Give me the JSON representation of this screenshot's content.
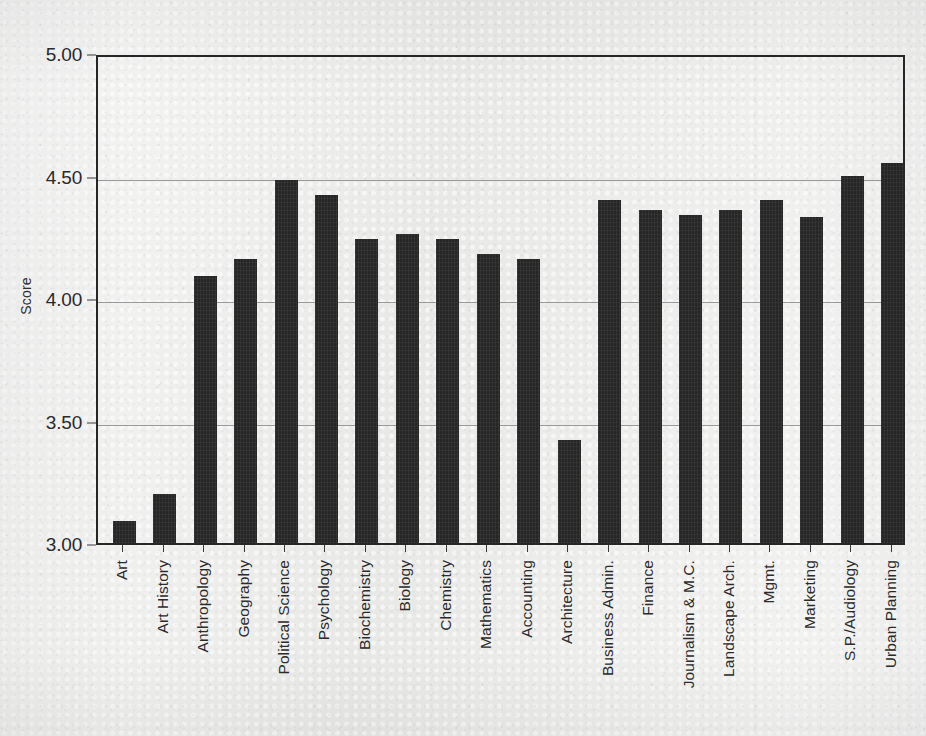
{
  "chart_data": {
    "type": "bar",
    "title": "",
    "subtitle": "",
    "xlabel": "",
    "ylabel": "Score",
    "ylim": [
      3.0,
      5.0
    ],
    "ytick_labels": [
      "5.00",
      "4.50",
      "4.00",
      "3.50",
      "3.00"
    ],
    "ytick_values": [
      5.0,
      4.5,
      4.0,
      3.5,
      3.0
    ],
    "gridlines": [
      4.5,
      4.0,
      3.5
    ],
    "grid": true,
    "legend": "none",
    "bar_color": "#262626",
    "axis_color": "#262626",
    "gridline_color": "#9a9a9a",
    "background_color": "#ececeb",
    "categories": [
      "Art",
      "Art History",
      "Anthropology",
      "Geography",
      "Political  Science",
      "Psychology",
      "Biochemistry",
      "Biology",
      "Chemistry",
      "Mathematics",
      "Accounting",
      "Architecture",
      "Business Admin.",
      "Finance",
      "Journalism & M.C.",
      "Landscape Arch.",
      "Mgmt.",
      "Marketing",
      "S.P./Audiology",
      "Urban Planning"
    ],
    "values": [
      3.09,
      3.2,
      4.09,
      4.16,
      4.48,
      4.42,
      4.24,
      4.26,
      4.24,
      4.18,
      4.16,
      3.42,
      4.4,
      4.36,
      4.34,
      4.36,
      4.4,
      4.33,
      4.5,
      4.55
    ]
  }
}
